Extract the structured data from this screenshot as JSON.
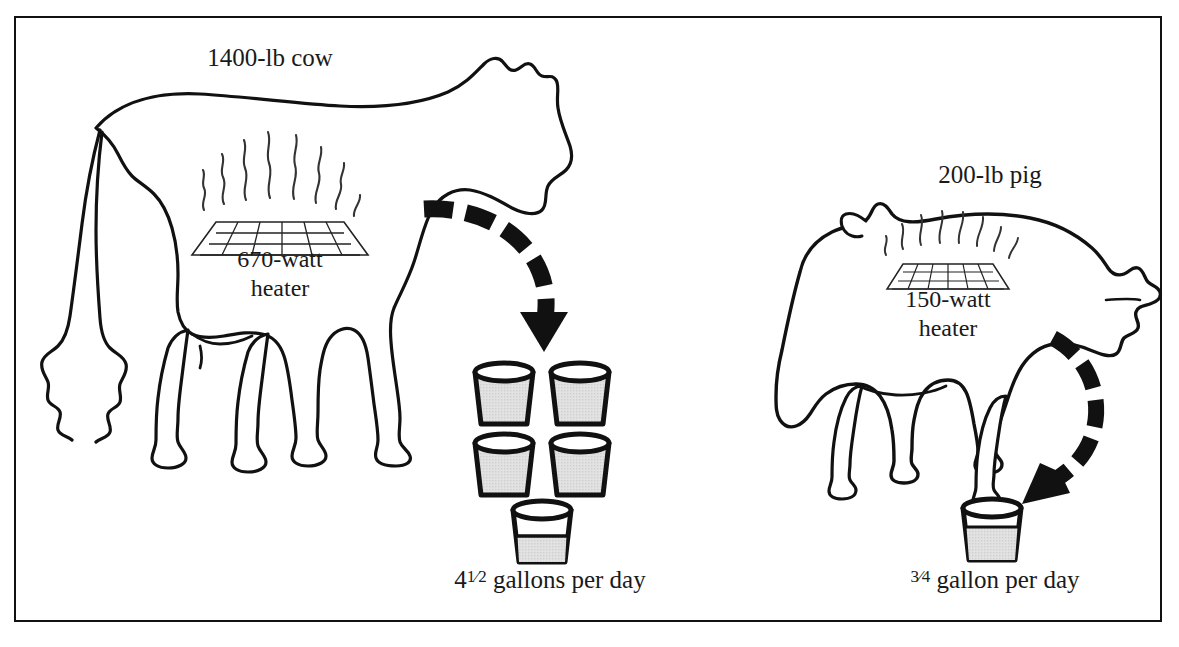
{
  "diagram": {
    "title_visible": false,
    "background_color": "#ffffff",
    "border_color": "#111111",
    "line_color": "#111111",
    "bucket_fill_color": "#dcdcdc",
    "arrow_color": "#111111"
  },
  "panels": [
    {
      "id": "cow",
      "animal_label": "1400-lb cow",
      "animal_icon": "cow-silhouette-icon",
      "heater_icon": "radiant-heater-icon",
      "heater_label_line1": "670-watt",
      "heater_label_line2": "heater",
      "heater_watts": 670,
      "arrow_icon": "dashed-curved-arrow-down-icon",
      "buckets_total_label_prefix": "4",
      "buckets_total_fraction_numerator": "1",
      "buckets_total_fraction_denominator": "2",
      "buckets_total_label_suffix": " gallons per day",
      "gallons_per_day": 4.5,
      "bucket_count_full": 4,
      "bucket_partial_fill": 0.5
    },
    {
      "id": "pig",
      "animal_label": "200-lb pig",
      "animal_icon": "pig-silhouette-icon",
      "heater_icon": "radiant-heater-icon",
      "heater_label_line1": "150-watt",
      "heater_label_line2": "heater",
      "heater_watts": 150,
      "arrow_icon": "dashed-curved-arrow-down-left-icon",
      "buckets_total_label_prefix": "",
      "buckets_total_fraction_numerator": "3",
      "buckets_total_fraction_denominator": "4",
      "buckets_total_label_suffix": " gallon per day",
      "gallons_per_day": 0.75,
      "bucket_count_full": 0,
      "bucket_partial_fill": 0.75
    }
  ]
}
